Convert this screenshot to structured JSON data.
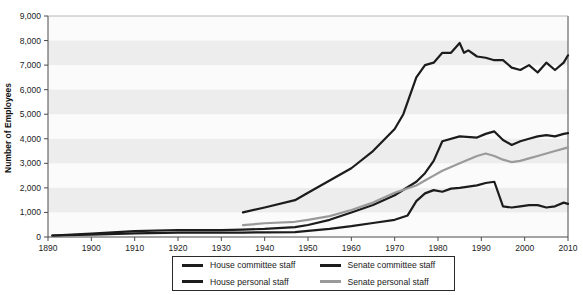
{
  "chart_data": {
    "type": "line",
    "title": "",
    "xlabel": "",
    "ylabel": "Number of Employees",
    "xlim": [
      1890,
      2010
    ],
    "ylim": [
      0,
      9000
    ],
    "xticks": [
      1890,
      1900,
      1910,
      1920,
      1930,
      1940,
      1950,
      1960,
      1970,
      1980,
      1990,
      2000,
      2010
    ],
    "yticks": [
      0,
      1000,
      2000,
      3000,
      4000,
      5000,
      6000,
      7000,
      8000,
      9000
    ],
    "ytick_labels": [
      "0",
      "1,000",
      "2,000",
      "3,000",
      "4,000",
      "5,000",
      "6,000",
      "7,000",
      "8,000",
      "9,000"
    ],
    "xtick_labels": [
      "1890",
      "1900",
      "1910",
      "1920",
      "1930",
      "1940",
      "1950",
      "1960",
      "1970",
      "1980",
      "1990",
      "2000",
      "2010"
    ],
    "grid": "horizontal-bands",
    "legend_position": "below",
    "series": [
      {
        "name": "House personal staff",
        "color": "#1c1c1c",
        "x": [
          1891,
          1900,
          1910,
          1920,
          1930,
          1935,
          1940,
          1947,
          1950,
          1955,
          1960,
          1965,
          1970,
          1975,
          1977,
          1979,
          1981,
          1985,
          1989,
          1991,
          1993,
          1995,
          1997,
          1999,
          2001,
          2003,
          2005,
          2007,
          2009,
          2010
        ],
        "values": [
          62,
          140,
          240,
          285,
          280,
          300,
          330,
          400,
          490,
          700,
          1000,
          1300,
          1700,
          2250,
          2600,
          3100,
          3900,
          4100,
          4050,
          4200,
          4300,
          3950,
          3750,
          3900,
          4000,
          4100,
          4150,
          4100,
          4200,
          4230
        ]
      },
      {
        "name": "Senate personal staff",
        "color": "#9a9a9a",
        "x": [
          1935,
          1940,
          1947,
          1950,
          1955,
          1960,
          1965,
          1970,
          1975,
          1977,
          1979,
          1981,
          1985,
          1989,
          1991,
          1993,
          1995,
          1997,
          1999,
          2001,
          2003,
          2005,
          2007,
          2009,
          2010
        ],
        "values": [
          480,
          560,
          620,
          700,
          850,
          1100,
          1400,
          1800,
          2100,
          2300,
          2500,
          2700,
          3000,
          3300,
          3400,
          3300,
          3150,
          3050,
          3100,
          3200,
          3300,
          3400,
          3500,
          3600,
          3650
        ]
      },
      {
        "name": "House committee staff",
        "color": "#1c1c1c",
        "x": [
          1891,
          1900,
          1910,
          1920,
          1930,
          1935,
          1940,
          1947,
          1950,
          1955,
          1960,
          1965,
          1970,
          1973,
          1975,
          1977,
          1979,
          1981,
          1983,
          1985,
          1987,
          1989,
          1991,
          1993,
          1995,
          1997,
          1999,
          2001,
          2003,
          2005,
          2007,
          2009,
          2010
        ],
        "values": [
          62,
          100,
          150,
          175,
          175,
          180,
          190,
          200,
          246,
          330,
          440,
          571,
          700,
          878,
          1460,
          1776,
          1909,
          1843,
          1970,
          2000,
          2050,
          2100,
          2200,
          2250,
          1250,
          1200,
          1250,
          1300,
          1300,
          1200,
          1250,
          1400,
          1350
        ]
      },
      {
        "name": "Senate committee staff",
        "color": "#1c1c1c",
        "x": [
          1935,
          1940,
          1947,
          1950,
          1955,
          1960,
          1965,
          1970,
          1972,
          1975,
          1977,
          1979,
          1981,
          1983,
          1985,
          1986,
          1987,
          1989,
          1991,
          1993,
          1995,
          1997,
          1999,
          2001,
          2003,
          2005,
          2007,
          2009,
          2010
        ],
        "values": [
          1000,
          1200,
          1500,
          1800,
          2300,
          2800,
          3500,
          4400,
          5000,
          6500,
          7000,
          7100,
          7500,
          7500,
          7900,
          7500,
          7600,
          7350,
          7300,
          7200,
          7200,
          6900,
          6800,
          7000,
          6700,
          7100,
          6800,
          7100,
          7400
        ]
      }
    ]
  },
  "legend": {
    "entries": [
      {
        "label": "House committee staff",
        "color": "#1c1c1c"
      },
      {
        "label": "Senate committee staff",
        "color": "#1c1c1c"
      },
      {
        "label": "House personal staff",
        "color": "#1c1c1c"
      },
      {
        "label": "Senate personal staff",
        "color": "#9a9a9a"
      }
    ]
  },
  "axis": {
    "y_title": "Number of Employees"
  },
  "style": {
    "band_color": "#ededed",
    "plot_bg": "#fbfbfb",
    "axis_color": "#4a4a4a",
    "legend_border": "#2a2a2a"
  }
}
